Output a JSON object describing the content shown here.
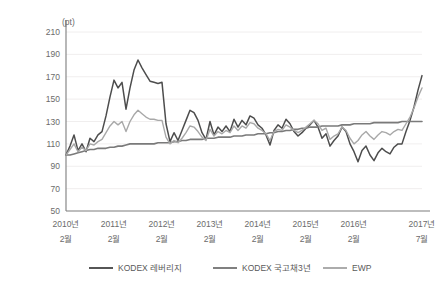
{
  "chart_data": {
    "type": "line",
    "title": "",
    "xlabel": "",
    "ylabel": "(pt)",
    "unit_label": "(pt)",
    "ylim": [
      50,
      210
    ],
    "yticks": [
      210,
      190,
      170,
      150,
      130,
      110,
      90,
      70,
      50
    ],
    "grid": true,
    "legend_position": "bottom",
    "x_tick_labels": [
      {
        "year": "2010년",
        "month": "2월"
      },
      {
        "year": "2011년",
        "month": "2월"
      },
      {
        "year": "2012년",
        "month": "2월"
      },
      {
        "year": "2013년",
        "month": "2월"
      },
      {
        "year": "2014년",
        "month": "2월"
      },
      {
        "year": "2015년",
        "month": "2월"
      },
      {
        "year": "2016년",
        "month": "2월"
      },
      {
        "year": "2017년",
        "month": "7월"
      }
    ],
    "x": [
      "2010-02",
      "2010-03",
      "2010-04",
      "2010-05",
      "2010-06",
      "2010-07",
      "2010-08",
      "2010-09",
      "2010-10",
      "2010-11",
      "2010-12",
      "2011-01",
      "2011-02",
      "2011-03",
      "2011-04",
      "2011-05",
      "2011-06",
      "2011-07",
      "2011-08",
      "2011-09",
      "2011-10",
      "2011-11",
      "2011-12",
      "2012-01",
      "2012-02",
      "2012-03",
      "2012-04",
      "2012-05",
      "2012-06",
      "2012-07",
      "2012-08",
      "2012-09",
      "2012-10",
      "2012-11",
      "2012-12",
      "2013-01",
      "2013-02",
      "2013-03",
      "2013-04",
      "2013-05",
      "2013-06",
      "2013-07",
      "2013-08",
      "2013-09",
      "2013-10",
      "2013-11",
      "2013-12",
      "2014-01",
      "2014-02",
      "2014-03",
      "2014-04",
      "2014-05",
      "2014-06",
      "2014-07",
      "2014-08",
      "2014-09",
      "2014-10",
      "2014-11",
      "2014-12",
      "2015-01",
      "2015-02",
      "2015-03",
      "2015-04",
      "2015-05",
      "2015-06",
      "2015-07",
      "2015-08",
      "2015-09",
      "2015-10",
      "2015-11",
      "2015-12",
      "2016-01",
      "2016-02",
      "2016-03",
      "2016-04",
      "2016-05",
      "2016-06",
      "2016-07",
      "2016-08",
      "2016-09",
      "2016-10",
      "2016-11",
      "2016-12",
      "2017-01",
      "2017-02",
      "2017-03",
      "2017-04",
      "2017-05",
      "2017-06",
      "2017-07"
    ],
    "series": [
      {
        "name": "KODEX 레버리지",
        "color": "#4d4d4d",
        "width": 1.5,
        "values": [
          100,
          108,
          118,
          104,
          110,
          103,
          115,
          112,
          118,
          121,
          135,
          152,
          167,
          160,
          165,
          141,
          160,
          176,
          185,
          178,
          172,
          166,
          165,
          164,
          165,
          128,
          112,
          120,
          113,
          122,
          131,
          140,
          138,
          131,
          120,
          114,
          130,
          118,
          125,
          121,
          126,
          121,
          132,
          125,
          131,
          127,
          135,
          133,
          127,
          124,
          118,
          109,
          122,
          127,
          124,
          132,
          128,
          121,
          117,
          120,
          124,
          127,
          131,
          125,
          115,
          119,
          108,
          113,
          117,
          125,
          121,
          110,
          103,
          94,
          104,
          108,
          100,
          95,
          102,
          106,
          103,
          101,
          107,
          110,
          110,
          121,
          131,
          143,
          158,
          171
        ]
      },
      {
        "name": "KODEX 국고채3년",
        "color": "#7a7a7a",
        "width": 1.6,
        "values": [
          100,
          100,
          101,
          102,
          103,
          104,
          105,
          105,
          106,
          106,
          106,
          107,
          107,
          108,
          108,
          109,
          110,
          110,
          110,
          110,
          110,
          110,
          110,
          111,
          111,
          111,
          111,
          112,
          112,
          113,
          113,
          114,
          114,
          114,
          114,
          115,
          115,
          115,
          116,
          116,
          116,
          116,
          117,
          117,
          117,
          118,
          118,
          118,
          119,
          119,
          119,
          120,
          120,
          121,
          121,
          122,
          122,
          123,
          123,
          124,
          124,
          125,
          125,
          125,
          126,
          126,
          126,
          126,
          126,
          127,
          127,
          127,
          128,
          128,
          128,
          128,
          128,
          129,
          129,
          129,
          129,
          129,
          129,
          129,
          130,
          130,
          130,
          130,
          130,
          130
        ]
      },
      {
        "name": "EWP",
        "color": "#a8a8a8",
        "width": 1.4,
        "values": [
          100,
          105,
          110,
          103,
          107,
          104,
          110,
          109,
          112,
          114,
          120,
          126,
          130,
          127,
          130,
          121,
          130,
          136,
          140,
          137,
          134,
          132,
          132,
          131,
          131,
          116,
          110,
          113,
          111,
          115,
          120,
          126,
          125,
          121,
          116,
          113,
          123,
          117,
          121,
          119,
          122,
          120,
          126,
          122,
          126,
          124,
          129,
          128,
          124,
          122,
          119,
          113,
          121,
          123,
          122,
          127,
          125,
          122,
          120,
          122,
          125,
          128,
          131,
          128,
          122,
          124,
          114,
          117,
          119,
          125,
          122,
          115,
          110,
          113,
          118,
          121,
          117,
          114,
          118,
          121,
          120,
          118,
          121,
          123,
          122,
          128,
          134,
          142,
          152,
          160
        ]
      }
    ]
  },
  "legend": {
    "items": [
      {
        "label": "KODEX 레버리지"
      },
      {
        "label": "KODEX 국고채3년"
      },
      {
        "label": "EWP"
      }
    ]
  }
}
